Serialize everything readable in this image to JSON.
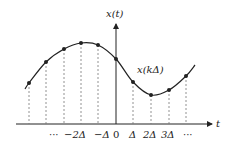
{
  "diagram": {
    "y_axis_label": "x(t)",
    "x_axis_label": "t",
    "curve_label": "x(kΔ)",
    "tick_labels": [
      "···",
      "−2Δ",
      "−Δ",
      "0",
      "Δ",
      "2Δ",
      "3Δ",
      "···"
    ],
    "samples": [
      {
        "x": 29,
        "y": 83
      },
      {
        "x": 46,
        "y": 62
      },
      {
        "x": 64,
        "y": 49
      },
      {
        "x": 81,
        "y": 43
      },
      {
        "x": 98,
        "y": 45
      },
      {
        "x": 116,
        "y": 59
      },
      {
        "x": 133,
        "y": 82
      },
      {
        "x": 151,
        "y": 95
      },
      {
        "x": 169,
        "y": 90
      },
      {
        "x": 186,
        "y": 76
      }
    ],
    "colors": {
      "line": "#222222",
      "dashed": "#777777"
    }
  }
}
